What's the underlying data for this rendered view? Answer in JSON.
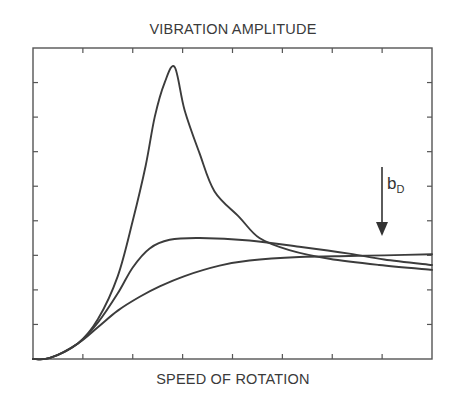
{
  "chart_data": {
    "type": "line",
    "title": "VIBRATION AMPLITUDE",
    "xlabel": "SPEED OF ROTATION",
    "ylabel": "",
    "xlim": [
      0,
      8
    ],
    "ylim": [
      0,
      9
    ],
    "x_ticks": 9,
    "y_ticks": 10,
    "tick_labels_shown": false,
    "grid": false,
    "legend": null,
    "annotation": {
      "text": "b",
      "subscript": "D",
      "arrow": "down",
      "meaning": "increasing damping"
    },
    "series": [
      {
        "name": "low damping",
        "x": [
          0,
          0.34,
          0.9,
          1.3,
          1.7,
          2.0,
          2.26,
          2.44,
          2.64,
          2.84,
          3.04,
          3.34,
          3.64,
          4.14,
          4.54,
          5.14,
          5.94,
          6.94,
          8.0
        ],
        "y": [
          0,
          0.03,
          0.45,
          1.15,
          2.4,
          4.0,
          5.6,
          7.0,
          8.0,
          8.45,
          7.2,
          5.95,
          4.85,
          4.1,
          3.5,
          3.15,
          2.9,
          2.72,
          2.58
        ]
      },
      {
        "name": "medium damping",
        "x": [
          0,
          0.34,
          0.9,
          1.3,
          1.7,
          2.0,
          2.34,
          2.74,
          3.34,
          4.34,
          5.34,
          6.34,
          7.04,
          8.0
        ],
        "y": [
          0,
          0.03,
          0.45,
          1.05,
          1.9,
          2.65,
          3.2,
          3.45,
          3.5,
          3.43,
          3.25,
          3.05,
          2.88,
          2.72
        ]
      },
      {
        "name": "high damping",
        "x": [
          0,
          0.34,
          0.9,
          1.3,
          1.7,
          2.14,
          2.54,
          3.04,
          3.74,
          4.34,
          5.34,
          6.34,
          7.04,
          8.0
        ],
        "y": [
          0,
          0.03,
          0.45,
          0.92,
          1.4,
          1.8,
          2.1,
          2.4,
          2.7,
          2.85,
          2.95,
          2.98,
          3.0,
          2.4
        ]
      }
    ]
  },
  "labels": {
    "title": "VIBRATION AMPLITUDE",
    "xlabel": "SPEED OF ROTATION",
    "annotation_base": "b",
    "annotation_sub": "D"
  },
  "colors": {
    "curve": "#3c3c3c",
    "axis": "#555555",
    "text": "#3a3a3a"
  }
}
